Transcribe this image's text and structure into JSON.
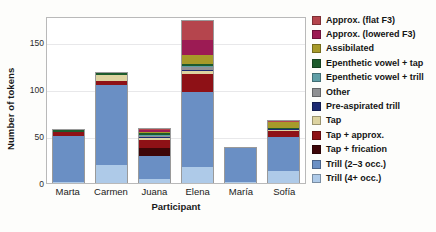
{
  "chart_data": {
    "type": "bar",
    "subtype": "stacked",
    "title": "",
    "xlabel": "Participant",
    "ylabel": "Number of tokens",
    "categories": [
      "Marta",
      "Carmen",
      "Juana",
      "Elena",
      "María",
      "Sofía"
    ],
    "ylim": [
      0,
      178
    ],
    "yticks": [
      0,
      50,
      100,
      150
    ],
    "ytick_labels": [
      "0",
      "50",
      "100",
      "150"
    ],
    "grid": true,
    "legend_position": "right",
    "series": [
      {
        "name": "Trill (4+ occ.)",
        "color": "#aecae8",
        "values": [
          1,
          19,
          4,
          17,
          1,
          13
        ]
      },
      {
        "name": "Trill (2–3 occ.)",
        "color": "#6a8fc4",
        "values": [
          49,
          85,
          25,
          80,
          36,
          36
        ]
      },
      {
        "name": "Tap + frication",
        "color": "#3d0608",
        "values": [
          0,
          0,
          8,
          0,
          0,
          0
        ]
      },
      {
        "name": "Tap + approx.",
        "color": "#8e1116",
        "values": [
          4,
          5,
          9,
          19,
          0,
          6
        ]
      },
      {
        "name": "Tap",
        "color": "#ddd3a0",
        "values": [
          0,
          6,
          2,
          3,
          0,
          2
        ]
      },
      {
        "name": "Pre-aspirated trill",
        "color": "#1c2a72",
        "values": [
          0,
          0,
          1,
          2,
          0,
          1
        ]
      },
      {
        "name": "Other",
        "color": "#8f9093",
        "values": [
          0,
          0,
          1,
          3,
          0,
          0
        ]
      },
      {
        "name": "Epenthetic vowel + trill",
        "color": "#5f9ea6",
        "values": [
          0,
          0,
          1,
          1,
          0,
          0
        ]
      },
      {
        "name": "Epenthetic vowel + tap",
        "color": "#1d5b2c",
        "values": [
          2,
          2,
          2,
          2,
          0,
          1
        ]
      },
      {
        "name": "Assibilated",
        "color": "#a79a29",
        "values": [
          1,
          0,
          1,
          10,
          0,
          6
        ]
      },
      {
        "name": "Approx. (lowered F3)",
        "color": "#9c1b54",
        "values": [
          0,
          0,
          2,
          15,
          0,
          0
        ]
      },
      {
        "name": "Approx. (flat F3)",
        "color": "#b5454d",
        "values": [
          0,
          0,
          2,
          21,
          0,
          1
        ]
      }
    ],
    "legend_entries": [
      {
        "label": "Approx. (flat F3)",
        "color": "#b5454d"
      },
      {
        "label": "Approx. (lowered F3)",
        "color": "#9c1b54"
      },
      {
        "label": "Assibilated",
        "color": "#a79a29"
      },
      {
        "label": "Epenthetic vowel + tap",
        "color": "#1d5b2c"
      },
      {
        "label": "Epenthetic vowel + trill",
        "color": "#5f9ea6"
      },
      {
        "label": "Other",
        "color": "#8f9093"
      },
      {
        "label": "Pre-aspirated trill",
        "color": "#1c2a72"
      },
      {
        "label": "Tap",
        "color": "#ddd3a0"
      },
      {
        "label": "Tap + approx.",
        "color": "#8e1116"
      },
      {
        "label": "Tap + frication",
        "color": "#3d0608"
      },
      {
        "label": "Trill (2–3 occ.)",
        "color": "#6a8fc4"
      },
      {
        "label": "Trill (4+ occ.)",
        "color": "#aecae8"
      }
    ]
  }
}
